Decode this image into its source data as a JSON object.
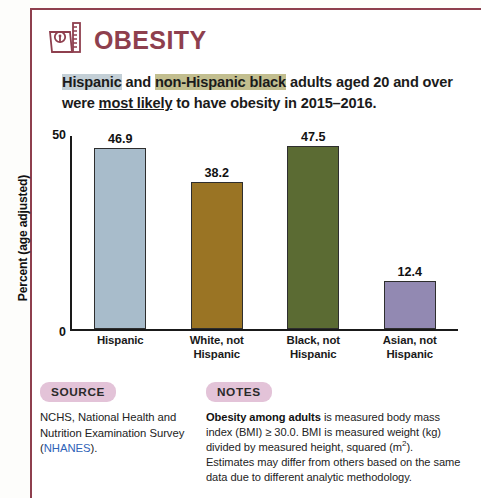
{
  "header": {
    "title": "OBESITY",
    "icon": "weight-scale-and-ruler-icon",
    "accent_color": "#8e3f4e"
  },
  "subtitle": {
    "segments": [
      {
        "text": "Hispanic",
        "highlight": "#c3cfd6",
        "underline": false
      },
      {
        "text": " and ",
        "highlight": null,
        "underline": false
      },
      {
        "text": "non-Hispanic black",
        "highlight": "#c2be8f",
        "underline": false
      },
      {
        "text": " adults aged 20 and over were ",
        "highlight": null,
        "underline": false
      },
      {
        "text": "most likely",
        "highlight": null,
        "underline": true
      },
      {
        "text": " to have obesity in 2015–2016.",
        "highlight": null,
        "underline": false
      }
    ],
    "full_text": "Hispanic and non-Hispanic black adults aged 20 and over were most likely to have obesity in 2015–2016."
  },
  "chart_data": {
    "type": "bar",
    "title": "",
    "xlabel": "",
    "ylabel": "Percent (age adjusted)",
    "categories": [
      "Hispanic",
      "White, not Hispanic",
      "Black, not Hispanic",
      "Asian, not Hispanic"
    ],
    "category_lines": [
      [
        "Hispanic"
      ],
      [
        "White, not",
        "Hispanic"
      ],
      [
        "Black, not",
        "Hispanic"
      ],
      [
        "Asian, not",
        "Hispanic"
      ]
    ],
    "values": [
      46.9,
      38.2,
      47.5,
      12.4
    ],
    "value_labels": [
      "46.9",
      "38.2",
      "47.5",
      "12.4"
    ],
    "colors": [
      "#a8bccb",
      "#9a7424",
      "#5b6b33",
      "#9289b2"
    ],
    "ylim": [
      0,
      50
    ],
    "yticks": [
      0,
      50
    ],
    "ytick_labels": [
      "0",
      "50"
    ],
    "grid": false,
    "legend": "none"
  },
  "footer": {
    "source": {
      "badge": "SOURCE",
      "text_before": "NCHS, National Health and Nutrition Examination Survey (",
      "link": "NHANES",
      "text_after": ")."
    },
    "notes": {
      "badge": "NOTES",
      "lead": "Obesity among adults",
      "body_1": " is measured body mass index (BMI) ≥ 30.0. BMI is measured weight (kg) divided by measured height, squared (m",
      "superscript": "2",
      "body_2": "). Estimates may differ from others based on the same data due to different analytic methodology."
    }
  }
}
